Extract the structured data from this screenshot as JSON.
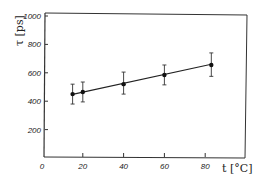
{
  "chart_data": {
    "type": "scatter",
    "title": "",
    "xlabel": "t [°C]",
    "ylabel": "τ [ps]",
    "xlim": [
      0,
      95
    ],
    "ylim": [
      0,
      1000
    ],
    "x_ticks": [
      0,
      20,
      40,
      60,
      80
    ],
    "y_ticks": [
      200,
      400,
      600,
      800,
      1000
    ],
    "grid": false,
    "legend": null,
    "series": [
      {
        "name": "τ vs t",
        "x": [
          15,
          20,
          40,
          60,
          83
        ],
        "values": [
          450,
          465,
          520,
          585,
          655
        ],
        "error_low": [
          380,
          395,
          450,
          515,
          575
        ],
        "error_high": [
          520,
          535,
          605,
          655,
          740
        ],
        "fit_line": {
          "x": [
            15,
            83
          ],
          "y": [
            448,
            660
          ]
        }
      }
    ]
  },
  "labels": {
    "x_axis": "t [°C]",
    "y_axis": "τ [ps]"
  }
}
